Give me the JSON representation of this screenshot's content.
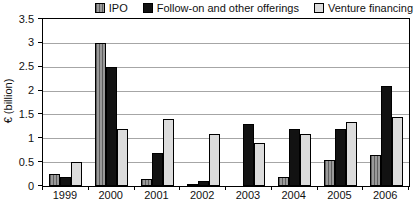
{
  "colors": {
    "ipo_bar": "#8c8c8c",
    "ipo_bar_stripe": "#5f5f5f",
    "followon_bar": "#121212",
    "venture_bar": "#dcdcdc",
    "bar_border": "#000000",
    "gridline": "#a6a6a6",
    "text": "#111111",
    "background": "#ffffff"
  },
  "chart_data": {
    "type": "bar",
    "title": "",
    "xlabel": "",
    "ylabel": "€ (billion)",
    "categories": [
      "1999",
      "2000",
      "2001",
      "2002",
      "2003",
      "2004",
      "2005",
      "2006"
    ],
    "series": [
      {
        "name": "IPO",
        "swatch": "striped-gray",
        "values": [
          0.25,
          3.0,
          0.15,
          0.05,
          0,
          0.2,
          0.55,
          0.65
        ]
      },
      {
        "name": "Follow-on and other offerings",
        "swatch": "black",
        "values": [
          0.2,
          2.5,
          0.7,
          0.1,
          1.3,
          1.2,
          1.2,
          2.1
        ]
      },
      {
        "name": "Venture financing",
        "swatch": "light-gray",
        "values": [
          0.5,
          1.2,
          1.4,
          1.1,
          0.9,
          1.1,
          1.35,
          1.45
        ]
      }
    ],
    "ylim": [
      0,
      3.5
    ],
    "yticks": [
      "0",
      "0.5",
      "1",
      "1.5",
      "2",
      "2.5",
      "3",
      "3.5"
    ],
    "grid": true,
    "legend_position": "top-right"
  }
}
